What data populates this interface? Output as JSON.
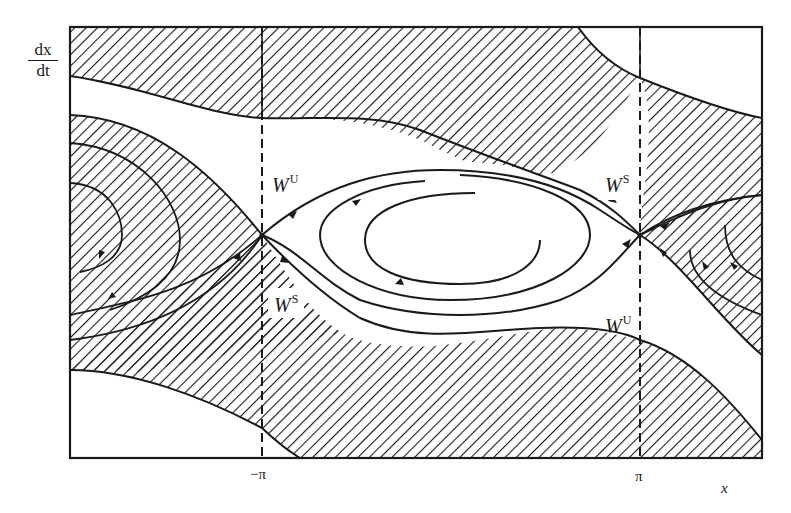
{
  "figure": {
    "type": "phase-portrait",
    "y_axis_label": {
      "numerator": "dx",
      "denominator": "dt"
    },
    "x_axis_label": "x",
    "x_ticks": [
      {
        "label": "−π",
        "position": "left-dashed-line"
      },
      {
        "label": "π",
        "position": "right-dashed-line"
      }
    ],
    "manifold_labels": [
      {
        "id": "wu-left",
        "base": "W",
        "sup": "U"
      },
      {
        "id": "ws-left",
        "base": "W",
        "sup": "S"
      },
      {
        "id": "ws-right",
        "base": "W",
        "sup": "S"
      },
      {
        "id": "wu-right",
        "base": "W",
        "sup": "U"
      }
    ],
    "colors": {
      "ink": "#1a1a1a",
      "background": "#ffffff",
      "hatch": "#1a1a1a"
    },
    "saddle_points": [
      "(−π, 0)",
      "(π, 0)"
    ],
    "regions": [
      "top hatched band",
      "upper-left hatched lobe with spirals",
      "central white eye with spiral orbit",
      "right hatched lobe with spirals",
      "bottom hatched band",
      "top-right white corner",
      "bottom-left white corner"
    ]
  }
}
